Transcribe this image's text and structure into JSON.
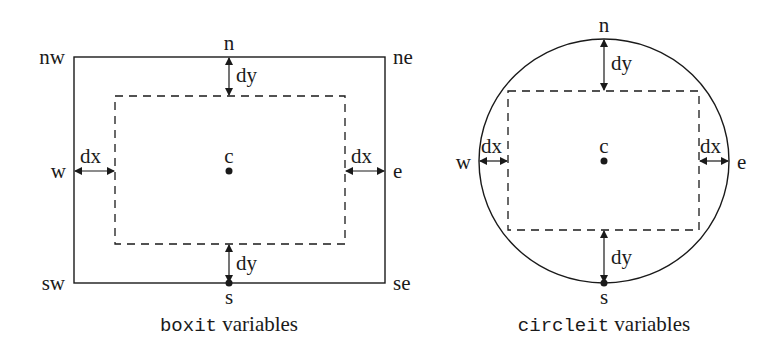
{
  "boxit": {
    "caption_code": "boxit",
    "caption_text": " variables",
    "corners": {
      "nw": "nw",
      "ne": "ne",
      "sw": "sw",
      "se": "se"
    },
    "points": {
      "n": "n",
      "s": "s",
      "e": "e",
      "w": "w",
      "c": "c"
    },
    "offsets": {
      "dx_left": "dx",
      "dx_right": "dx",
      "dy_top": "dy",
      "dy_bottom": "dy"
    }
  },
  "circleit": {
    "caption_code": "circleit",
    "caption_text": " variables",
    "points": {
      "n": "n",
      "s": "s",
      "e": "e",
      "w": "w",
      "c": "c"
    },
    "offsets": {
      "dx_left": "dx",
      "dx_right": "dx",
      "dy_top": "dy",
      "dy_bottom": "dy"
    }
  },
  "colors": {
    "stroke": "#1a1a1a",
    "background": "#ffffff"
  }
}
